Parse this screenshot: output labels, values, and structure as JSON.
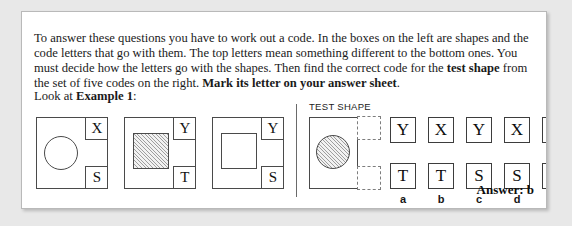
{
  "instructions": {
    "part1": "To answer these questions you have to work out a code. In the boxes on the left are shapes and the code letters that go with them. The top letters mean something different to the bottom ones. You must decide how the letters go with the shapes. Then find the correct code for the ",
    "bold1": "test shape",
    "part2": " from the set of five codes on the right. ",
    "bold2": "Mark its letter on your answer sheet",
    "part3": "."
  },
  "look_line": {
    "prefix": "Look at ",
    "bold": "Example 1",
    "suffix": ":"
  },
  "test_shape_label": "TEST SHAPE",
  "examples": [
    {
      "shape": "circle",
      "fill": "none",
      "top_letter": "X",
      "bottom_letter": "S"
    },
    {
      "shape": "square",
      "fill": "hatched",
      "top_letter": "Y",
      "bottom_letter": "T"
    },
    {
      "shape": "square",
      "fill": "none",
      "top_letter": "Y",
      "bottom_letter": "S"
    }
  ],
  "test_shape": {
    "shape": "circle",
    "fill": "hatched",
    "top_letter": "",
    "bottom_letter": ""
  },
  "options": [
    {
      "label": "a",
      "top": "Y",
      "bottom": "T"
    },
    {
      "label": "b",
      "top": "X",
      "bottom": "T"
    },
    {
      "label": "c",
      "top": "Y",
      "bottom": "S"
    },
    {
      "label": "d",
      "top": "X",
      "bottom": "S"
    },
    {
      "label": "e",
      "top": "X",
      "bottom": "Y"
    }
  ],
  "answer": "Answer: b",
  "colors": {
    "page_background": "#ffffff",
    "outer_background": "#e8e8e8",
    "border": "#b9b9b9",
    "ink": "#1a1a1a",
    "line": "#4a4a4a",
    "dashed": "#7d7d7d"
  }
}
